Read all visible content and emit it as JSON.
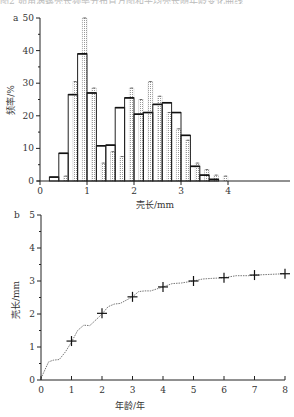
{
  "caption_fragment": "图2 卵角涡螺壳长频率分布直方图和平均壳长随年龄变化曲线",
  "chart_data": [
    {
      "panel": "a",
      "type": "bar",
      "title": "",
      "xlabel": "壳长/mm",
      "ylabel": "频率/%",
      "xlim": [
        0,
        5
      ],
      "ylim": [
        0,
        50
      ],
      "xticks": [
        "0",
        "1",
        "2",
        "3",
        "4"
      ],
      "yticks": [
        "0",
        "10",
        "20",
        "30",
        "40",
        "50"
      ],
      "bin_width": 0.2,
      "series": [
        {
          "name": "solid-outline",
          "style": "outline",
          "bins": [
            0.2,
            0.4,
            0.6,
            0.8,
            1.0,
            1.2,
            1.4,
            1.6,
            1.8,
            2.0,
            2.2,
            2.4,
            2.6,
            2.8,
            3.0,
            3.2,
            3.4,
            3.6
          ],
          "values": [
            1.2,
            8.5,
            26.5,
            39,
            27,
            10.8,
            11,
            22.5,
            25.5,
            20.5,
            21,
            23.5,
            24,
            21,
            14,
            4.5,
            1.8,
            0.5
          ]
        },
        {
          "name": "dotted",
          "style": "stippled",
          "bins": [
            0.4,
            0.6,
            0.8,
            1.0,
            1.2,
            1.4,
            1.6,
            1.8,
            2.0,
            2.2,
            2.4,
            2.6,
            2.8,
            3.0,
            3.2,
            3.4,
            3.6,
            3.8
          ],
          "values": [
            1.5,
            30.5,
            50,
            28.5,
            5.5,
            9,
            7.5,
            28.5,
            25,
            30.5,
            26,
            21,
            16,
            12.5,
            5.5,
            3.5,
            1.8,
            1.5
          ]
        }
      ],
      "grid": false,
      "legend": null
    },
    {
      "panel": "b",
      "type": "line",
      "title": "",
      "xlabel": "年龄/年",
      "ylabel": "壳长/mm",
      "xlim": [
        0,
        8
      ],
      "ylim": [
        0,
        5
      ],
      "xticks": [
        "0",
        "1",
        "2",
        "3",
        "4",
        "5",
        "6",
        "7",
        "8"
      ],
      "yticks": [
        "0",
        "1",
        "2",
        "3",
        "4",
        "5"
      ],
      "series": [
        {
          "name": "mean shell length (markers)",
          "marker": "+",
          "x": [
            1,
            2,
            3,
            4,
            5,
            6,
            7,
            8
          ],
          "y": [
            1.18,
            2.02,
            2.52,
            2.82,
            3.0,
            3.1,
            3.18,
            3.22
          ]
        },
        {
          "name": "growth curve (dotted)",
          "x": [
            0,
            0.1,
            0.25,
            0.4,
            0.6,
            0.8,
            1.0,
            1.2,
            1.4,
            1.6,
            1.8,
            2.0,
            2.2,
            2.4,
            2.6,
            2.8,
            3.0,
            3.2,
            3.4,
            3.6,
            3.8,
            4.0,
            4.3,
            4.6,
            5.0,
            5.3,
            5.6,
            6.0,
            6.4,
            6.8,
            7.0,
            7.5,
            8.0
          ],
          "y": [
            0.05,
            0.25,
            0.55,
            0.6,
            0.62,
            0.85,
            1.15,
            1.5,
            1.66,
            1.65,
            1.82,
            2.0,
            2.22,
            2.3,
            2.32,
            2.42,
            2.52,
            2.68,
            2.7,
            2.7,
            2.76,
            2.82,
            2.92,
            2.94,
            3.0,
            3.06,
            3.08,
            3.1,
            3.16,
            3.16,
            3.18,
            3.2,
            3.22
          ]
        }
      ],
      "grid": false,
      "legend": null
    }
  ]
}
